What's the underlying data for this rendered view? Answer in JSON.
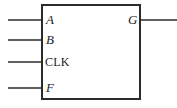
{
  "diagram": {
    "type": "logic-block",
    "canvas": {
      "width": 177,
      "height": 108,
      "background": "#ffffff"
    },
    "stroke_color": "#2b2b2b",
    "block": {
      "name": "logic-block-rectangle",
      "x": 41,
      "y": 4,
      "width": 100,
      "height": 96,
      "stroke_width": 2,
      "fill": "#ffffff"
    },
    "inputs": [
      {
        "label": "A",
        "style": "italic",
        "y": 20,
        "wire_x_start": 8,
        "wire_x_end": 41
      },
      {
        "label": "B",
        "style": "italic",
        "y": 40,
        "wire_x_start": 8,
        "wire_x_end": 41
      },
      {
        "label": "CLK",
        "style": "upright",
        "y": 62,
        "wire_x_start": 8,
        "wire_x_end": 41
      },
      {
        "label": "F",
        "style": "italic",
        "y": 88,
        "wire_x_start": 8,
        "wire_x_end": 41
      }
    ],
    "outputs": [
      {
        "label": "G",
        "style": "italic",
        "y": 20,
        "wire_x_start": 141,
        "wire_x_end": 177
      }
    ]
  }
}
